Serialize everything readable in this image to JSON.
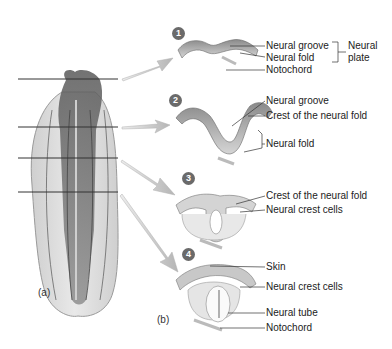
{
  "figure": {
    "panel_a_label": "(a)",
    "panel_b_label": "(b)"
  },
  "stages": [
    {
      "number": "1",
      "labels": [
        "Neural groove",
        "Neural fold",
        "Notochord"
      ],
      "bracket_label_line1": "Neural",
      "bracket_label_line2": "plate"
    },
    {
      "number": "2",
      "labels": [
        "Neural groove",
        "Crest of the neural fold",
        "Neural fold"
      ]
    },
    {
      "number": "3",
      "labels": [
        "Crest of the neural fold",
        "Neural crest cells"
      ]
    },
    {
      "number": "4",
      "labels": [
        "Skin",
        "Neural crest cells",
        "Neural tube",
        "Notochord"
      ]
    }
  ],
  "colors": {
    "embryo_dark": "#6b6b6b",
    "embryo_light": "#d8d8d8",
    "arrow": "#c8c8c8",
    "badge": "#6a6a6a",
    "line": "#333333"
  }
}
